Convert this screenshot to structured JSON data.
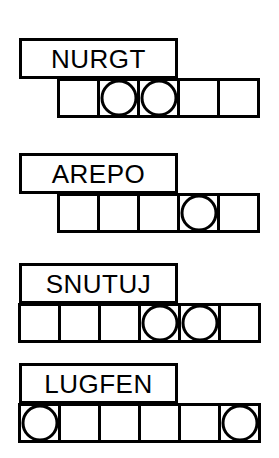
{
  "sheet": {
    "title": "word-shape-puzzle-worksheet",
    "ink_color": "#000000",
    "paper_color": "#ffffff",
    "stroke_width_px": 3,
    "cell_size_px": 40,
    "rows": [
      {
        "word": "NURGT",
        "label_box": {
          "x": 19,
          "y": 38,
          "width": 159,
          "height": 41
        },
        "grid": {
          "x": 57,
          "y": 78,
          "cell_count": 5,
          "cell_size": 40
        },
        "circle_cells": [
          1,
          2
        ]
      },
      {
        "word": "AREPO",
        "label_box": {
          "x": 19,
          "y": 153,
          "width": 159,
          "height": 41
        },
        "grid": {
          "x": 57,
          "y": 193,
          "cell_count": 5,
          "cell_size": 40
        },
        "circle_cells": [
          3
        ]
      },
      {
        "word": "SNUTUJ",
        "label_box": {
          "x": 19,
          "y": 263,
          "width": 159,
          "height": 41
        },
        "grid": {
          "x": 18,
          "y": 303,
          "cell_count": 6,
          "cell_size": 40
        },
        "circle_cells": [
          3,
          4
        ]
      },
      {
        "word": "LUGFEN",
        "label_box": {
          "x": 19,
          "y": 363,
          "width": 159,
          "height": 41
        },
        "grid": {
          "x": 18,
          "y": 403,
          "cell_count": 6,
          "cell_size": 40
        },
        "circle_cells": [
          0,
          5
        ]
      }
    ]
  }
}
